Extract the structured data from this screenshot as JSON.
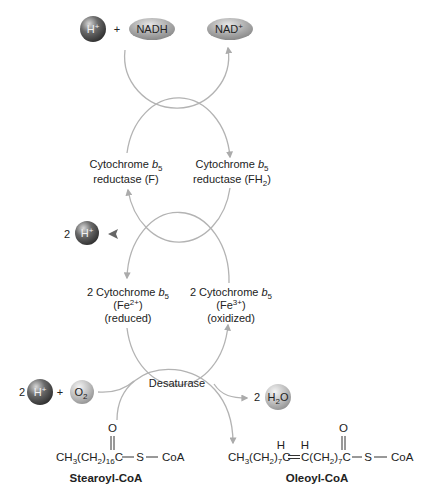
{
  "top_reaction": {
    "proton": {
      "symbol": "H",
      "charge": "+"
    },
    "plus": "+",
    "nadh": "NADH",
    "nad": {
      "symbol": "NAD",
      "charge": "+"
    }
  },
  "reductase": {
    "left": {
      "line1": "Cytochrome ",
      "b": "b",
      "b_sub": "5",
      "line2": "reductase (F)"
    },
    "right": {
      "line1": "Cytochrome ",
      "b": "b",
      "b_sub": "5",
      "line2_a": "reductase (FH",
      "line2_sub": "2",
      "line2_b": ")"
    }
  },
  "proton_release": {
    "count": "2",
    "symbol": "H",
    "charge": "+"
  },
  "cytochrome_b5": {
    "left": {
      "line1": "2 Cytochrome ",
      "b": "b",
      "b_sub": "5",
      "iron_a": "(Fe",
      "iron_sup": "2+",
      "iron_b": ")",
      "state": "(reduced)"
    },
    "right": {
      "line1": "2 Cytochrome ",
      "b": "b",
      "b_sub": "5",
      "iron_a": "(Fe",
      "iron_sup": "3+",
      "iron_b": ")",
      "state": "(oxidized)"
    }
  },
  "desaturase": {
    "label": "Desaturase",
    "inputs": {
      "proton_count": "2",
      "proton_symbol": "H",
      "proton_charge": "+",
      "plus": "+",
      "oxygen_symbol": "O",
      "oxygen_sub": "2"
    },
    "output": {
      "count": "2",
      "water_a": "H",
      "water_sub": "2",
      "water_b": "O"
    }
  },
  "substrate": {
    "name": "Stearoyl-CoA",
    "formula": {
      "p1": "CH",
      "s1": "3",
      "p2": "(CH",
      "s2": "2",
      "p3": ")",
      "s3": "16",
      "p4": "C",
      "carbonyl_o": "O",
      "sulfur": "S",
      "coa": "CoA"
    }
  },
  "product": {
    "name": "Oleoyl-CoA",
    "formula": {
      "p1": "CH",
      "s1": "3",
      "p2": "(CH",
      "s2": "2",
      "p3": ")",
      "s3": "7",
      "p4": "C",
      "p5": "C(CH",
      "s5": "2",
      "p6": ")",
      "s6": "7",
      "p7": "C",
      "alkene_h1": "H",
      "alkene_h2": "H",
      "carbonyl_o": "O",
      "sulfur": "S",
      "coa": "CoA"
    }
  },
  "colors": {
    "cycle_arc": "#b3b3b3",
    "proton_arrow": "#666666",
    "proton_sphere": "#4a4a4a",
    "nad_ellipse": "#a6a6a6",
    "molecule_sphere": "#b8b8b8"
  }
}
